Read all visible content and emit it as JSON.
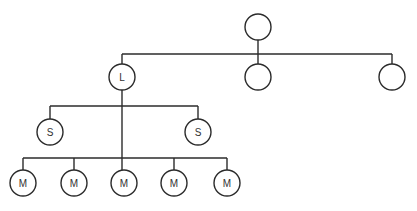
{
  "diagram": {
    "type": "tree",
    "stroke_color": "#2b2b2b",
    "node_radius": 13,
    "nodes": [
      {
        "id": "root",
        "label": "",
        "x": 258,
        "y": 27
      },
      {
        "id": "L",
        "label": "L",
        "x": 122,
        "y": 77
      },
      {
        "id": "c2",
        "label": "",
        "x": 258,
        "y": 77
      },
      {
        "id": "c3",
        "label": "",
        "x": 392,
        "y": 77
      },
      {
        "id": "S1",
        "label": "S",
        "x": 50,
        "y": 132
      },
      {
        "id": "S2",
        "label": "S",
        "x": 198,
        "y": 132
      },
      {
        "id": "M1",
        "label": "M",
        "x": 23,
        "y": 183
      },
      {
        "id": "M2",
        "label": "M",
        "x": 74,
        "y": 183
      },
      {
        "id": "M3",
        "label": "M",
        "x": 124,
        "y": 183
      },
      {
        "id": "M4",
        "label": "M",
        "x": 174,
        "y": 183
      },
      {
        "id": "M5",
        "label": "M",
        "x": 227,
        "y": 183
      }
    ],
    "edges": [
      {
        "from": "root",
        "to": [
          "L",
          "c2",
          "c3"
        ],
        "bus_y": 54
      },
      {
        "from": "L",
        "to": [
          "S1",
          "S2"
        ],
        "bus_y": 106
      },
      {
        "from": "L",
        "to": [
          "M1",
          "M2",
          "M3",
          "M4",
          "M5"
        ],
        "bus_y": 158
      }
    ]
  }
}
